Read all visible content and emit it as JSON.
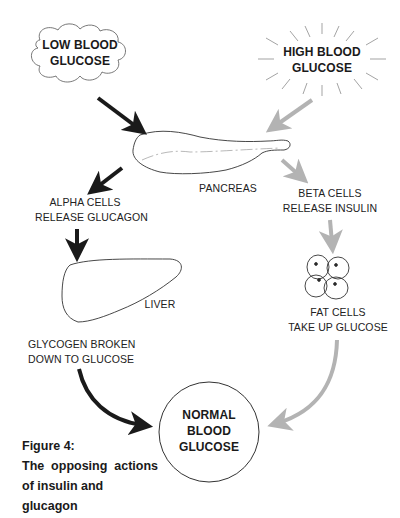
{
  "nodes": {
    "low_glucose": [
      "LOW BLOOD",
      "GLUCOSE"
    ],
    "high_glucose": [
      "HIGH BLOOD",
      "GLUCOSE"
    ],
    "pancreas": "PANCREAS",
    "alpha_cells": [
      "ALPHA CELLS",
      "RELEASE GLUCAGON"
    ],
    "beta_cells": [
      "BETA CELLS",
      "RELEASE INSULIN"
    ],
    "liver": "LIVER",
    "fat_cells": [
      "FAT CELLS",
      "TAKE UP GLUCOSE"
    ],
    "glycogen": [
      "GLYCOGEN BROKEN",
      "DOWN TO GLUCOSE"
    ],
    "normal_glucose": [
      "NORMAL",
      "BLOOD",
      "GLUCOSE"
    ]
  },
  "caption": {
    "title": "Figure 4:",
    "line2_words": [
      "The",
      "opposing",
      "actions"
    ],
    "line3": "of insulin and glucagon"
  },
  "colors": {
    "glucagon_path": "#1a1a1a",
    "insulin_path": "#b3b3b3",
    "outline": "#333333"
  }
}
